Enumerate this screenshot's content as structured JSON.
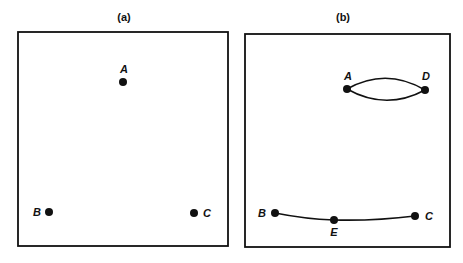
{
  "panels": [
    {
      "title": "(a)",
      "nodes": [
        {
          "id": "A",
          "label": "A"
        },
        {
          "id": "B",
          "label": "B"
        },
        {
          "id": "C",
          "label": "C"
        }
      ],
      "edges": []
    },
    {
      "title": "(b)",
      "nodes": [
        {
          "id": "A",
          "label": "A"
        },
        {
          "id": "D",
          "label": "D"
        },
        {
          "id": "B",
          "label": "B"
        },
        {
          "id": "E",
          "label": "E"
        },
        {
          "id": "C",
          "label": "C"
        }
      ],
      "edges": [
        {
          "from": "A",
          "to": "D",
          "style": "curved-upper"
        },
        {
          "from": "A",
          "to": "D",
          "style": "curved-lower"
        },
        {
          "from": "B",
          "to": "E"
        },
        {
          "from": "E",
          "to": "C"
        }
      ]
    }
  ],
  "colors": {
    "stroke": "#111111",
    "background": "#ffffff"
  }
}
